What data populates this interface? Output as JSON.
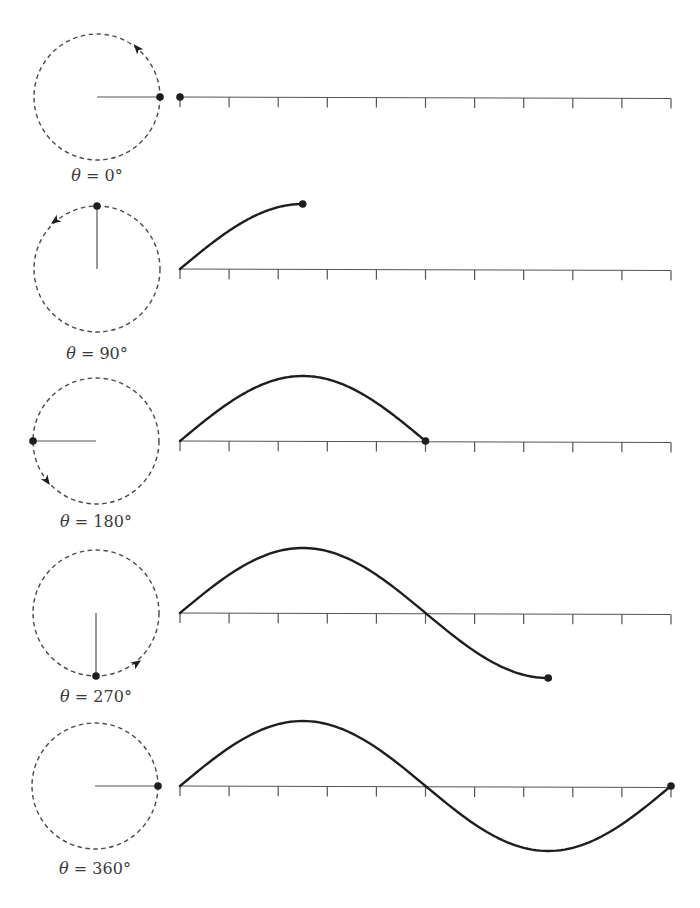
{
  "figure": {
    "colors": {
      "ink": "#1e1e1e",
      "circle": "#4a4a4a",
      "axis": "#555555",
      "label": "#3a3a3a",
      "background": "#ffffff"
    },
    "circle_radius": 63,
    "axis": {
      "x_start": 180,
      "x_end": 671,
      "tick_count": 11,
      "tick_length": 10
    },
    "amplitude": 65,
    "panels": [
      {
        "angle_deg": 0,
        "label_symbol": "θ",
        "label_text": " = 0°",
        "cx": 97,
        "cy": 97,
        "label_y": 168,
        "arrow": {
          "x": 137,
          "y": 48,
          "dir_deg": -130
        }
      },
      {
        "angle_deg": 90,
        "label_symbol": "θ",
        "label_text": " = 90°",
        "cx": 97,
        "cy": 269,
        "label_y": 346,
        "arrow": {
          "x": 55,
          "y": 221,
          "dir_deg": 145
        }
      },
      {
        "angle_deg": 180,
        "label_symbol": "θ",
        "label_text": " = 180°",
        "cx": 96,
        "cy": 441,
        "label_y": 514,
        "arrow": {
          "x": 47,
          "y": 481,
          "dir_deg": 55
        }
      },
      {
        "angle_deg": 270,
        "label_symbol": "θ",
        "label_text": " = 270°",
        "cx": 96,
        "cy": 613,
        "label_y": 689,
        "arrow": {
          "x": 137,
          "y": 663,
          "dir_deg": -35
        }
      },
      {
        "angle_deg": 360,
        "label_symbol": "θ",
        "label_text": " = 360°",
        "cx": 95,
        "cy": 786,
        "label_y": 861,
        "arrow": null
      }
    ]
  },
  "chart_data": {
    "type": "line",
    "xlabel": "",
    "ylabel": "",
    "x_ticks_count": 11,
    "x_range_deg": [
      0,
      360
    ],
    "series": [
      {
        "name": "θ = 0°",
        "end_angle_deg": 0,
        "end_value": 0
      },
      {
        "name": "θ = 90°",
        "end_angle_deg": 90,
        "end_value": 1
      },
      {
        "name": "θ = 180°",
        "end_angle_deg": 180,
        "end_value": 0
      },
      {
        "name": "θ = 270°",
        "end_angle_deg": 270,
        "end_value": -1
      },
      {
        "name": "θ = 360°",
        "end_angle_deg": 360,
        "end_value": 0
      }
    ],
    "function": "y = sin(θ)",
    "grid": false
  }
}
